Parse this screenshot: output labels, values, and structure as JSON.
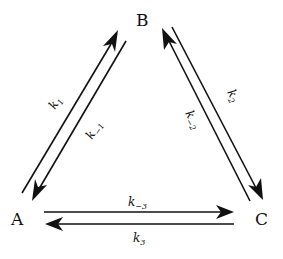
{
  "diagram": {
    "type": "reaction-network",
    "nodes": {
      "A": {
        "label": "A"
      },
      "B": {
        "label": "B"
      },
      "C": {
        "label": "C"
      }
    },
    "edges": [
      {
        "from": "A",
        "to": "B",
        "rate": "k",
        "sub": "1"
      },
      {
        "from": "B",
        "to": "A",
        "rate": "k",
        "sub": "−1"
      },
      {
        "from": "B",
        "to": "C",
        "rate": "k",
        "sub": "2"
      },
      {
        "from": "C",
        "to": "B",
        "rate": "k",
        "sub": "−2"
      },
      {
        "from": "A",
        "to": "C",
        "rate": "k",
        "sub": "−3"
      },
      {
        "from": "C",
        "to": "A",
        "rate": "k",
        "sub": "3"
      }
    ],
    "colors": {
      "stroke": "#111111",
      "background": "#ffffff"
    }
  }
}
